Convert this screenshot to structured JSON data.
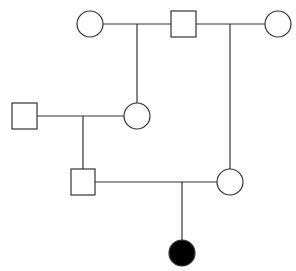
{
  "diagram": {
    "type": "pedigree",
    "stroke_color": "#333333",
    "fill_affected": "#000000",
    "fill_unaffected": "#ffffff",
    "individuals": [
      {
        "id": "gen1-female-left",
        "sex": "female",
        "affected": false,
        "cx": 90,
        "cy": 24
      },
      {
        "id": "gen1-male",
        "sex": "male",
        "affected": false,
        "cx": 183,
        "cy": 24
      },
      {
        "id": "gen1-female-right",
        "sex": "female",
        "affected": false,
        "cx": 278,
        "cy": 24
      },
      {
        "id": "gen2-male-left",
        "sex": "male",
        "affected": false,
        "cx": 24,
        "cy": 116
      },
      {
        "id": "gen2-female-middle",
        "sex": "female",
        "affected": false,
        "cx": 137,
        "cy": 116
      },
      {
        "id": "gen3-male",
        "sex": "male",
        "affected": false,
        "cx": 83,
        "cy": 182
      },
      {
        "id": "gen3-female",
        "sex": "female",
        "affected": false,
        "cx": 230,
        "cy": 182
      },
      {
        "id": "gen4-female-affected",
        "sex": "female",
        "affected": true,
        "cx": 182,
        "cy": 253
      }
    ]
  }
}
